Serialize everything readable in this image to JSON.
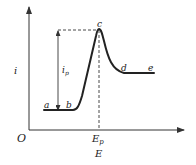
{
  "diagram": {
    "type": "linear sweep voltammogram",
    "axes": {
      "origin_label": "O",
      "y_label": "i",
      "x_label": "E",
      "x_tick_label_main": "E",
      "x_tick_label_sub": "p"
    },
    "peak_current": {
      "main": "i",
      "sub": "p"
    },
    "points": [
      {
        "label": "a"
      },
      {
        "label": "b"
      },
      {
        "label": "c"
      },
      {
        "label": "d"
      },
      {
        "label": "e"
      }
    ],
    "colors": {
      "line": "#222222",
      "background": "#ffffff"
    }
  }
}
